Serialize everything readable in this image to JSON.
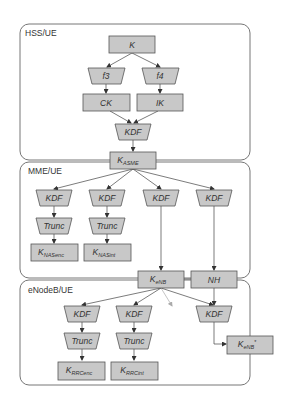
{
  "regions": {
    "hss": "HSS/UE",
    "mme": "MME/UE",
    "enb": "eNodeB/UE"
  },
  "nodes": {
    "k": {
      "main": "K",
      "sub": ""
    },
    "f3": {
      "main": "f3",
      "sub": ""
    },
    "f4": {
      "main": "f4",
      "sub": ""
    },
    "ck": {
      "main": "CK",
      "sub": ""
    },
    "ik": {
      "main": "IK",
      "sub": ""
    },
    "kdf_hss": {
      "main": "KDF",
      "sub": ""
    },
    "kasme": {
      "main": "K",
      "sub": "ASME"
    },
    "kdf_mme1": {
      "main": "KDF",
      "sub": ""
    },
    "kdf_mme2": {
      "main": "KDF",
      "sub": ""
    },
    "kdf_mme3": {
      "main": "KDF",
      "sub": ""
    },
    "kdf_mme4": {
      "main": "KDF",
      "sub": ""
    },
    "trunc_mme1": {
      "main": "Trunc",
      "sub": ""
    },
    "trunc_mme2": {
      "main": "Trunc",
      "sub": ""
    },
    "knasenc": {
      "main": "K",
      "sub": "NASenc"
    },
    "knasint": {
      "main": "K",
      "sub": "NASint"
    },
    "kenb": {
      "main": "K",
      "sub": "eNB"
    },
    "nh": {
      "main": "NH",
      "sub": ""
    },
    "kdf_enb1": {
      "main": "KDF",
      "sub": ""
    },
    "kdf_enb2": {
      "main": "KDF",
      "sub": ""
    },
    "kdf_enb3": {
      "main": "KDF",
      "sub": ""
    },
    "trunc_enb1": {
      "main": "Trunc",
      "sub": ""
    },
    "trunc_enb2": {
      "main": "Trunc",
      "sub": ""
    },
    "krrcenc": {
      "main": "K",
      "sub": "RRCenc"
    },
    "krrcint": {
      "main": "K",
      "sub": "RRCint"
    },
    "kenbstar": {
      "main": "K",
      "sub": "eNB",
      "sup": "*"
    }
  },
  "colors": {
    "node_fill": "#c8c8c8",
    "node_stroke": "#555555",
    "edge": "#444444",
    "region_stroke": "#666666"
  }
}
